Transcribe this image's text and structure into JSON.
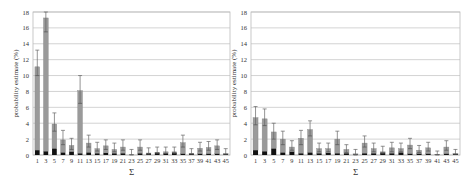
{
  "chart_data": [
    {
      "type": "bar",
      "stacked": true,
      "ylabel": "probability estimate (%)",
      "xlabel": "Σ",
      "ylim": [
        0,
        18
      ],
      "yticks": [
        0,
        2,
        4,
        6,
        8,
        10,
        12,
        14,
        16,
        18
      ],
      "grid": true,
      "categories": [
        "1",
        "3",
        "5",
        "7",
        "9",
        "11",
        "13",
        "15",
        "17",
        "19",
        "21",
        "23",
        "25",
        "27",
        "29",
        "31",
        "33",
        "35",
        "37",
        "39",
        "41",
        "43",
        "45"
      ],
      "series": [
        {
          "name": "dark",
          "color": "#111111",
          "values": [
            0.6,
            0.45,
            0.8,
            0.3,
            0.4,
            0.2,
            0.3,
            0.2,
            0.25,
            0.2,
            0.2,
            0.05,
            0.2,
            0.2,
            0.3,
            0.2,
            0.3,
            0.15,
            0.15,
            0.15,
            0.15,
            0.15,
            0.1
          ]
        },
        {
          "name": "gray",
          "color": "#9a9a9a",
          "values": [
            10.5,
            16.8,
            3.1,
            1.6,
            0.8,
            7.9,
            1.2,
            0.6,
            0.9,
            0.5,
            0.8,
            0.0,
            0.8,
            0.05,
            0.05,
            0.2,
            0.1,
            1.4,
            0.05,
            0.7,
            0.8,
            1.0,
            0.1
          ]
        }
      ],
      "totals": [
        11.1,
        17.25,
        3.9,
        1.9,
        1.2,
        8.1,
        1.5,
        0.8,
        1.15,
        0.7,
        1.0,
        0.05,
        1.0,
        0.25,
        0.35,
        0.4,
        0.4,
        1.55,
        0.2,
        0.85,
        0.95,
        1.15,
        0.2
      ],
      "error_upper": [
        13.2,
        18.0,
        5.3,
        3.1,
        2.1,
        10.0,
        2.5,
        1.6,
        1.9,
        1.5,
        1.9,
        0.7,
        1.9,
        0.9,
        1.0,
        1.0,
        1.0,
        2.5,
        0.8,
        1.6,
        1.7,
        1.9,
        0.8
      ],
      "error_lower": [
        10.0,
        15.5,
        3.0,
        1.3,
        0.7,
        6.5,
        1.0,
        0.5,
        0.7,
        0.4,
        0.6,
        0.0,
        0.6,
        0.1,
        0.2,
        0.2,
        0.2,
        1.0,
        0.1,
        0.5,
        0.6,
        0.7,
        0.1
      ]
    },
    {
      "type": "bar",
      "stacked": true,
      "ylabel": "probability estimate (%)",
      "xlabel": "Σ",
      "ylim": [
        0,
        18
      ],
      "yticks": [
        0,
        2,
        4,
        6,
        8,
        10,
        12,
        14,
        16,
        18
      ],
      "grid": true,
      "categories": [
        "1",
        "3",
        "5",
        "7",
        "9",
        "11",
        "13",
        "15",
        "17",
        "19",
        "21",
        "23",
        "25",
        "27",
        "29",
        "31",
        "33",
        "35",
        "37",
        "39",
        "41",
        "43",
        "45"
      ],
      "series": [
        {
          "name": "dark",
          "color": "#111111",
          "values": [
            0.6,
            0.45,
            0.8,
            0.3,
            0.4,
            0.2,
            0.3,
            0.2,
            0.25,
            0.2,
            0.2,
            0.05,
            0.2,
            0.2,
            0.3,
            0.2,
            0.3,
            0.15,
            0.15,
            0.15,
            0.05,
            0.15,
            0.1
          ]
        },
        {
          "name": "gray",
          "color": "#9a9a9a",
          "values": [
            4.1,
            4.1,
            2.1,
            1.7,
            0.6,
            1.9,
            2.9,
            0.6,
            0.55,
            1.8,
            0.5,
            0.1,
            1.3,
            0.6,
            0.1,
            0.7,
            0.5,
            1.1,
            0.45,
            0.75,
            0.05,
            0.85,
            0.1
          ]
        }
      ],
      "totals": [
        4.7,
        4.55,
        2.9,
        2.0,
        1.0,
        2.1,
        3.2,
        0.8,
        0.8,
        2.0,
        0.7,
        0.15,
        1.5,
        0.8,
        0.4,
        0.9,
        0.8,
        1.25,
        0.6,
        0.9,
        0.1,
        1.0,
        0.2
      ],
      "error_upper": [
        6.1,
        5.8,
        4.0,
        3.0,
        1.8,
        3.1,
        4.3,
        1.5,
        1.5,
        3.0,
        1.3,
        0.7,
        2.4,
        1.5,
        1.1,
        1.6,
        1.5,
        2.1,
        1.2,
        1.6,
        0.5,
        1.8,
        0.7
      ],
      "error_lower": [
        3.8,
        3.7,
        2.0,
        1.3,
        0.6,
        1.3,
        2.4,
        0.4,
        0.4,
        1.3,
        0.3,
        0.0,
        1.0,
        0.4,
        0.2,
        0.4,
        0.4,
        0.8,
        0.3,
        0.5,
        0.0,
        0.6,
        0.1
      ]
    }
  ]
}
